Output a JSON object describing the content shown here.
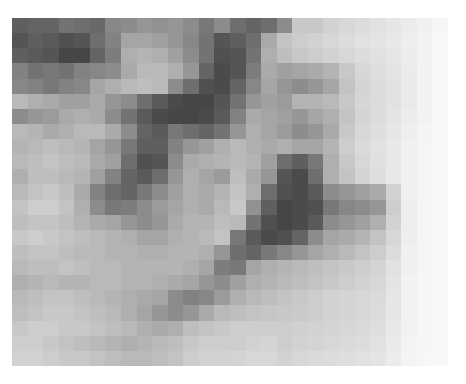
{
  "image": {
    "description": "pixelated grayscale intensity map",
    "cols": 28,
    "rows": 23,
    "gray": [
      [
        95,
        100,
        100,
        115,
        110,
        105,
        135,
        140,
        150,
        145,
        150,
        140,
        120,
        140,
        110,
        100,
        110,
        140,
        200,
        200,
        210,
        215,
        220,
        225,
        230,
        235,
        240,
        245
      ],
      [
        85,
        95,
        90,
        80,
        85,
        110,
        130,
        165,
        165,
        160,
        150,
        135,
        115,
        85,
        95,
        110,
        170,
        195,
        205,
        210,
        215,
        220,
        225,
        228,
        232,
        238,
        242,
        248
      ],
      [
        95,
        90,
        85,
        70,
        70,
        100,
        125,
        175,
        180,
        175,
        160,
        140,
        115,
        80,
        85,
        115,
        175,
        190,
        200,
        205,
        210,
        215,
        220,
        225,
        230,
        236,
        242,
        248
      ],
      [
        130,
        115,
        120,
        115,
        130,
        135,
        140,
        170,
        185,
        185,
        175,
        150,
        100,
        75,
        85,
        125,
        170,
        160,
        165,
        170,
        180,
        200,
        215,
        222,
        228,
        235,
        242,
        248
      ],
      [
        135,
        130,
        120,
        130,
        135,
        165,
        175,
        185,
        190,
        185,
        140,
        110,
        80,
        75,
        100,
        135,
        165,
        150,
        140,
        150,
        165,
        195,
        212,
        220,
        226,
        234,
        242,
        248
      ],
      [
        185,
        175,
        170,
        160,
        160,
        170,
        150,
        140,
        110,
        90,
        75,
        70,
        70,
        85,
        115,
        150,
        160,
        155,
        180,
        180,
        185,
        200,
        214,
        220,
        226,
        234,
        242,
        248
      ],
      [
        140,
        150,
        155,
        170,
        175,
        170,
        140,
        115,
        90,
        75,
        70,
        70,
        75,
        90,
        130,
        170,
        165,
        160,
        150,
        165,
        175,
        195,
        212,
        220,
        228,
        236,
        242,
        248
      ],
      [
        185,
        180,
        170,
        175,
        185,
        185,
        170,
        140,
        100,
        90,
        120,
        110,
        100,
        115,
        150,
        175,
        165,
        155,
        140,
        150,
        170,
        200,
        215,
        222,
        230,
        238,
        244,
        248
      ],
      [
        180,
        185,
        190,
        185,
        180,
        165,
        150,
        120,
        95,
        95,
        130,
        150,
        160,
        175,
        185,
        175,
        170,
        175,
        165,
        165,
        180,
        205,
        218,
        225,
        232,
        240,
        245,
        248
      ],
      [
        185,
        190,
        195,
        190,
        185,
        170,
        160,
        110,
        80,
        85,
        140,
        170,
        175,
        180,
        185,
        180,
        160,
        110,
        95,
        120,
        175,
        200,
        215,
        224,
        232,
        240,
        245,
        248
      ],
      [
        175,
        190,
        190,
        185,
        180,
        160,
        130,
        100,
        90,
        110,
        150,
        175,
        165,
        155,
        190,
        170,
        150,
        85,
        75,
        110,
        175,
        195,
        212,
        222,
        232,
        240,
        245,
        248
      ],
      [
        185,
        195,
        200,
        190,
        170,
        130,
        110,
        100,
        120,
        140,
        160,
        175,
        170,
        180,
        195,
        175,
        110,
        80,
        75,
        90,
        140,
        150,
        160,
        170,
        210,
        240,
        245,
        248
      ],
      [
        195,
        205,
        205,
        195,
        175,
        140,
        120,
        125,
        140,
        155,
        165,
        175,
        170,
        185,
        200,
        145,
        95,
        70,
        75,
        80,
        120,
        135,
        140,
        150,
        205,
        238,
        245,
        248
      ],
      [
        190,
        195,
        195,
        190,
        180,
        170,
        165,
        150,
        140,
        150,
        170,
        180,
        180,
        190,
        185,
        115,
        80,
        70,
        75,
        90,
        140,
        150,
        160,
        175,
        210,
        238,
        245,
        248
      ],
      [
        200,
        205,
        200,
        195,
        190,
        185,
        180,
        175,
        165,
        165,
        175,
        180,
        185,
        195,
        120,
        90,
        75,
        80,
        100,
        140,
        165,
        170,
        180,
        195,
        215,
        238,
        245,
        248
      ],
      [
        190,
        195,
        195,
        190,
        185,
        185,
        180,
        180,
        175,
        175,
        180,
        180,
        175,
        150,
        110,
        100,
        120,
        135,
        150,
        165,
        175,
        185,
        195,
        205,
        220,
        240,
        245,
        248
      ],
      [
        185,
        190,
        190,
        195,
        190,
        185,
        185,
        180,
        180,
        180,
        180,
        175,
        165,
        125,
        120,
        165,
        175,
        180,
        185,
        190,
        195,
        200,
        205,
        212,
        225,
        240,
        245,
        248
      ],
      [
        175,
        180,
        185,
        180,
        180,
        185,
        185,
        180,
        180,
        175,
        170,
        165,
        150,
        140,
        160,
        175,
        180,
        185,
        190,
        195,
        200,
        205,
        210,
        215,
        228,
        242,
        246,
        248
      ],
      [
        185,
        190,
        195,
        195,
        190,
        185,
        180,
        175,
        170,
        165,
        140,
        130,
        135,
        155,
        175,
        185,
        190,
        195,
        200,
        205,
        210,
        212,
        215,
        218,
        230,
        242,
        246,
        248
      ],
      [
        190,
        195,
        200,
        200,
        195,
        190,
        185,
        175,
        165,
        150,
        140,
        150,
        170,
        185,
        190,
        195,
        198,
        200,
        202,
        205,
        210,
        212,
        215,
        220,
        230,
        242,
        246,
        248
      ],
      [
        200,
        205,
        205,
        200,
        200,
        195,
        190,
        185,
        175,
        170,
        175,
        190,
        195,
        200,
        205,
        205,
        205,
        205,
        208,
        210,
        212,
        215,
        218,
        222,
        232,
        242,
        246,
        248
      ],
      [
        205,
        205,
        200,
        195,
        190,
        185,
        180,
        175,
        180,
        185,
        190,
        200,
        205,
        205,
        205,
        210,
        212,
        205,
        210,
        212,
        215,
        218,
        220,
        225,
        234,
        244,
        246,
        248
      ],
      [
        210,
        210,
        205,
        200,
        200,
        195,
        190,
        185,
        185,
        190,
        195,
        205,
        210,
        210,
        212,
        215,
        215,
        210,
        215,
        218,
        220,
        222,
        225,
        228,
        236,
        244,
        247,
        248
      ]
    ]
  }
}
